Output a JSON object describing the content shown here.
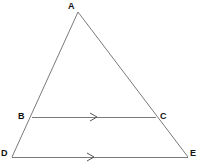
{
  "figure": {
    "kind": "geometry-diagram",
    "canvas": {
      "width": 199,
      "height": 164,
      "background": "#ffffff"
    },
    "style": {
      "line_color": "#7a7a7a",
      "line_width": 1,
      "label_color": "#111111",
      "label_size_px": 9,
      "arrow_color": "#555555"
    },
    "points": {
      "A": {
        "name": "A",
        "x": 78,
        "y": 12
      },
      "B": {
        "name": "B",
        "x": 32,
        "y": 117
      },
      "C": {
        "name": "C",
        "x": 156,
        "y": 117
      },
      "D": {
        "name": "D",
        "x": 12,
        "y": 157
      },
      "E": {
        "name": "E",
        "x": 188,
        "y": 157
      }
    },
    "labels": [
      {
        "id": "A",
        "text": "A",
        "x": 68,
        "y": 1
      },
      {
        "id": "B",
        "text": "B",
        "x": 18,
        "y": 111
      },
      {
        "id": "C",
        "text": "C",
        "x": 160,
        "y": 111
      },
      {
        "id": "D",
        "text": "D",
        "x": 1,
        "y": 148
      },
      {
        "id": "E",
        "text": "E",
        "x": 190,
        "y": 148
      }
    ],
    "segments": [
      {
        "id": "AD",
        "from": "A",
        "to": "D",
        "x1": 78,
        "y1": 12,
        "x2": 12,
        "y2": 157,
        "arrows": 0
      },
      {
        "id": "AE",
        "from": "A",
        "to": "E",
        "x1": 78,
        "y1": 12,
        "x2": 188,
        "y2": 157,
        "arrows": 0
      },
      {
        "id": "BC",
        "from": "B",
        "to": "C",
        "x1": 32,
        "y1": 117,
        "x2": 156,
        "y2": 117,
        "arrows": 1
      },
      {
        "id": "DE",
        "from": "D",
        "to": "E",
        "x1": 12,
        "y1": 157,
        "x2": 188,
        "y2": 157,
        "arrows": 1
      }
    ],
    "parallel_marks": [
      {
        "id": "mark-bc",
        "on_segment": "BC",
        "glyph": "chevron-right",
        "x": 94,
        "y": 117
      },
      {
        "id": "mark-de",
        "on_segment": "DE",
        "glyph": "chevron-right",
        "x": 91,
        "y": 157
      }
    ]
  }
}
